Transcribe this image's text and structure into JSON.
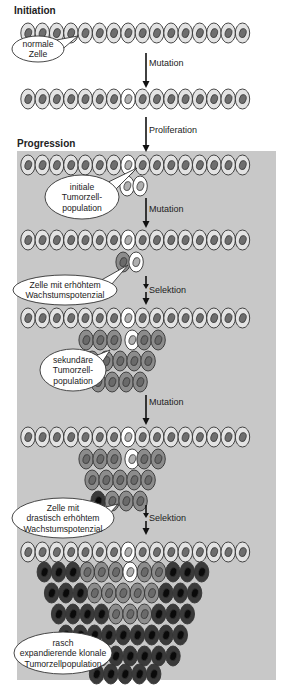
{
  "sections": {
    "initiation": "Initiation",
    "progression": "Progression"
  },
  "steps": [
    {
      "label": "Mutation"
    },
    {
      "label": "Proliferation"
    },
    {
      "label": "Mutation"
    },
    {
      "label": "Selektion"
    },
    {
      "label": "Mutation"
    },
    {
      "label": "Selektion"
    }
  ],
  "callouts": [
    {
      "lines": [
        "normale",
        "Zelle"
      ]
    },
    {
      "lines": [
        "initiale",
        "Tumorzell-",
        "population"
      ]
    },
    {
      "lines": [
        "Zelle mit erhöhtem",
        "Wachstumspotenzial"
      ]
    },
    {
      "lines": [
        "sekundäre",
        "Tumorzell-",
        "population"
      ]
    },
    {
      "lines": [
        "Zelle mit",
        "drastisch erhöhtem",
        "Wachstumspotenzial"
      ]
    },
    {
      "lines": [
        "rasch",
        "expandierende klonale",
        "Tumorzellpopulation"
      ]
    }
  ],
  "colors": {
    "background_progression": "#c8c8c8",
    "normal_cell": "#e3e3e3",
    "normal_nucleus": "#6e6e6e",
    "initial_tumor_cell": "#ffffff",
    "initial_tumor_nucleus": "#b0b0b0",
    "secondary_cell": "#8c8c8c",
    "secondary_nucleus": "#6a6a6a",
    "aggressive_cell": "#3a3a3a",
    "aggressive_nucleus": "#0a0a0a",
    "outline": "#333333"
  },
  "legend_cell_types": [
    "normal",
    "initial",
    "secondary",
    "aggressive"
  ]
}
